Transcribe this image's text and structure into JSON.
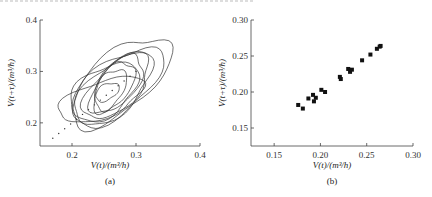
{
  "chart_data": [
    {
      "type": "line",
      "panel": "a",
      "caption": "(a)",
      "title": "",
      "xlabel": "V(t)/(m³/h)",
      "ylabel": "V(t+τ)/(m³/h)",
      "xlim": [
        0.15,
        0.4
      ],
      "ylim": [
        0.155,
        0.4
      ],
      "xticks": [
        {
          "v": 0.2,
          "label": "0.2"
        },
        {
          "v": 0.3,
          "label": "0.3"
        },
        {
          "v": 0.4,
          "label": "0.4"
        }
      ],
      "yticks": [
        {
          "v": 0.2,
          "label": "0.2"
        },
        {
          "v": 0.3,
          "label": "0.3"
        },
        {
          "v": 0.4,
          "label": "0.4"
        }
      ],
      "grid": false,
      "description": "Phase-space trajectory: nested closed loops elongated along the diagonal, plus dotted diagonal guide line",
      "loops": [
        {
          "cx": 0.275,
          "cy": 0.28,
          "rx": 0.095,
          "ry": 0.055,
          "angle": 40
        },
        {
          "cx": 0.27,
          "cy": 0.27,
          "rx": 0.085,
          "ry": 0.05,
          "angle": 38
        },
        {
          "cx": 0.265,
          "cy": 0.265,
          "rx": 0.075,
          "ry": 0.045,
          "angle": 42
        },
        {
          "cx": 0.27,
          "cy": 0.27,
          "rx": 0.065,
          "ry": 0.04,
          "angle": 45
        },
        {
          "cx": 0.27,
          "cy": 0.275,
          "rx": 0.055,
          "ry": 0.035,
          "angle": 50
        },
        {
          "cx": 0.265,
          "cy": 0.27,
          "rx": 0.045,
          "ry": 0.03,
          "angle": 55
        },
        {
          "cx": 0.26,
          "cy": 0.265,
          "rx": 0.035,
          "ry": 0.025,
          "angle": 60
        },
        {
          "cx": 0.255,
          "cy": 0.26,
          "rx": 0.02,
          "ry": 0.015,
          "angle": 30
        },
        {
          "cx": 0.25,
          "cy": 0.26,
          "rx": 0.06,
          "ry": 0.045,
          "angle": 35
        },
        {
          "cx": 0.245,
          "cy": 0.245,
          "rx": 0.07,
          "ry": 0.035,
          "angle": 20
        }
      ],
      "diagonal_dots": {
        "from": [
          0.17,
          0.17
        ],
        "to": [
          0.3,
          0.3
        ]
      }
    },
    {
      "type": "scatter",
      "panel": "b",
      "caption": "(b)",
      "title": "",
      "xlabel": "V(t)/(m³/h)",
      "ylabel": "V(t+τ)/(m³/h)",
      "xlim": [
        0.125,
        0.3
      ],
      "ylim": [
        0.125,
        0.3
      ],
      "xticks": [
        {
          "v": 0.15,
          "label": "0.15"
        },
        {
          "v": 0.2,
          "label": "0.20"
        },
        {
          "v": 0.25,
          "label": "0.25"
        },
        {
          "v": 0.3,
          "label": "0.30"
        }
      ],
      "yticks": [
        {
          "v": 0.15,
          "label": "0.15"
        },
        {
          "v": 0.2,
          "label": "0.20"
        },
        {
          "v": 0.25,
          "label": "0.25"
        },
        {
          "v": 0.3,
          "label": "0.30"
        }
      ],
      "grid": false,
      "points": [
        {
          "x": 0.176,
          "y": 0.182
        },
        {
          "x": 0.181,
          "y": 0.177
        },
        {
          "x": 0.187,
          "y": 0.191
        },
        {
          "x": 0.192,
          "y": 0.196
        },
        {
          "x": 0.193,
          "y": 0.187
        },
        {
          "x": 0.195,
          "y": 0.192
        },
        {
          "x": 0.201,
          "y": 0.203
        },
        {
          "x": 0.205,
          "y": 0.2
        },
        {
          "x": 0.221,
          "y": 0.221
        },
        {
          "x": 0.222,
          "y": 0.218
        },
        {
          "x": 0.23,
          "y": 0.232
        },
        {
          "x": 0.232,
          "y": 0.228
        },
        {
          "x": 0.234,
          "y": 0.231
        },
        {
          "x": 0.245,
          "y": 0.244
        },
        {
          "x": 0.254,
          "y": 0.252
        },
        {
          "x": 0.261,
          "y": 0.26
        },
        {
          "x": 0.264,
          "y": 0.263
        },
        {
          "x": 0.265,
          "y": 0.264
        }
      ]
    }
  ]
}
